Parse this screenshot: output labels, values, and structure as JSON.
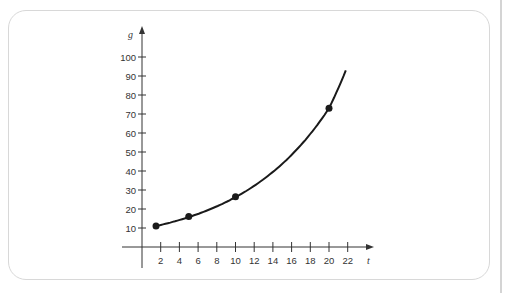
{
  "chart_data": {
    "type": "line",
    "title": "",
    "xlabel": "t",
    "ylabel": "g",
    "x_ticks": [
      2,
      4,
      6,
      8,
      10,
      12,
      14,
      16,
      18,
      20,
      22
    ],
    "y_ticks": [
      10,
      20,
      30,
      40,
      50,
      60,
      70,
      80,
      90,
      100
    ],
    "xlim": [
      0,
      24
    ],
    "ylim": [
      0,
      105
    ],
    "grid": false,
    "legend": null,
    "series": [
      {
        "name": "curve",
        "kind": "exponential",
        "x": [
          1.5,
          5,
          10,
          15,
          20,
          21.8
        ],
        "y": [
          11,
          16,
          26.5,
          44,
          73,
          94
        ]
      }
    ],
    "points": [
      {
        "x": 1.5,
        "y": 11
      },
      {
        "x": 5,
        "y": 16
      },
      {
        "x": 10,
        "y": 26.5
      },
      {
        "x": 20,
        "y": 73
      }
    ],
    "colors": {
      "curve": "#1a1a1a",
      "axis": "#333333",
      "frame": "#d8d8d8"
    }
  }
}
